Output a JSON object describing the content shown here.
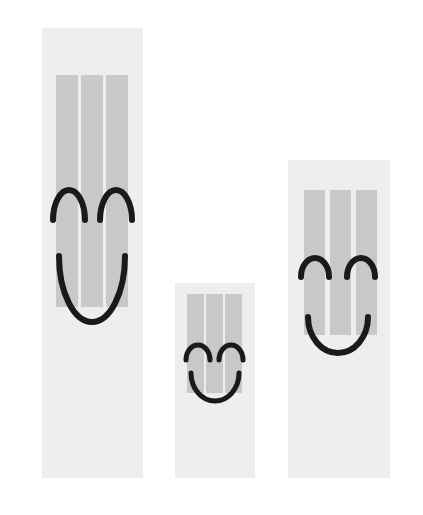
{
  "canvas": {
    "width": 423,
    "height": 515,
    "background_color": "#ffffff",
    "description": "Three vertical light-gray panels of differing heights, each striped with three vertical gray bars and overlaid with a black smiley face outline"
  },
  "palette": {
    "background": "#ffffff",
    "card_fill": "#eeeeee",
    "bar_fill": "#c8c8c8",
    "face_stroke": "#1a1a1a"
  },
  "figures": [
    {
      "id": "figure-left",
      "name": "tall-striped-smiley-panel",
      "order_label": "1",
      "size_label": "tall",
      "x": 42,
      "y": 28,
      "width": 101,
      "height": 450,
      "card_fill": "#eeeeee",
      "bars": {
        "count": 3,
        "fill": "#c8c8c8",
        "y": 47,
        "height": 232,
        "x_positions": [
          14,
          39,
          64
        ],
        "width": 22
      },
      "face": {
        "stroke": "#1a1a1a",
        "stroke_width": 6,
        "eyes": [
          {
            "name": "left-eye",
            "cx": 27,
            "cy": 162,
            "rx": 16,
            "ry": 30
          },
          {
            "name": "right-eye",
            "cx": 74,
            "cy": 162,
            "rx": 16,
            "ry": 30
          }
        ],
        "mouth": {
          "name": "mouth",
          "cx": 50,
          "cy": 294,
          "rx": 33,
          "ry": 66
        }
      }
    },
    {
      "id": "figure-middle",
      "name": "short-striped-smiley-panel",
      "order_label": "2",
      "size_label": "short",
      "x": 175,
      "y": 283,
      "width": 80,
      "height": 195,
      "card_fill": "#eeeeee",
      "bars": {
        "count": 3,
        "fill": "#c8c8c8",
        "y": 11,
        "height": 99,
        "x_positions": [
          12,
          31,
          50
        ],
        "width": 17
      },
      "face": {
        "stroke": "#1a1a1a",
        "stroke_width": 5,
        "eyes": [
          {
            "name": "left-eye",
            "cx": 23,
            "cy": 62,
            "rx": 12,
            "ry": 15
          },
          {
            "name": "right-eye",
            "cx": 56,
            "cy": 62,
            "rx": 12,
            "ry": 15
          }
        ],
        "mouth": {
          "name": "mouth",
          "cx": 40,
          "cy": 118,
          "rx": 24,
          "ry": 28
        }
      }
    },
    {
      "id": "figure-right",
      "name": "medium-striped-smiley-panel",
      "order_label": "3",
      "size_label": "medium",
      "x": 288,
      "y": 160,
      "width": 102,
      "height": 318,
      "card_fill": "#eeeeee",
      "bars": {
        "count": 3,
        "fill": "#c8c8c8",
        "y": 30,
        "height": 145,
        "x_positions": [
          16,
          42,
          68
        ],
        "width": 21
      },
      "face": {
        "stroke": "#1a1a1a",
        "stroke_width": 6,
        "eyes": [
          {
            "name": "left-eye",
            "cx": 27,
            "cy": 98,
            "rx": 14,
            "ry": 19
          },
          {
            "name": "right-eye",
            "cx": 73,
            "cy": 98,
            "rx": 14,
            "ry": 19
          }
        ],
        "mouth": {
          "name": "mouth",
          "cx": 50,
          "cy": 193,
          "rx": 30,
          "ry": 36
        }
      }
    }
  ]
}
